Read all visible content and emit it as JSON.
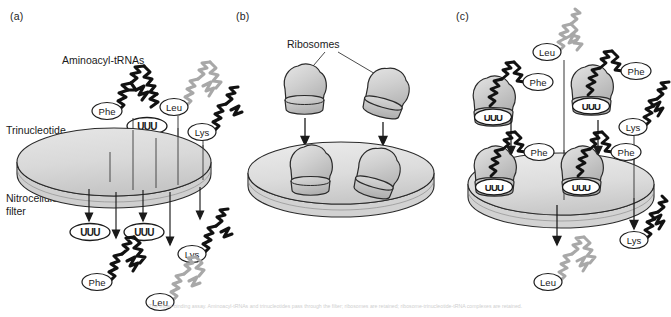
{
  "figure": {
    "width": 671,
    "height": 317,
    "caption": "The triplet-binding assay. Aminoacyl-tRNAs and trinucleotides pass through the filter; ribosomes are retained; ribosome-trinucleotide-tRNA complexes are retained."
  },
  "colors": {
    "ink": "#1a1a1a",
    "outline": "#2a2a2a",
    "disk_fill_top": "#d8d8d8",
    "disk_fill_edge": "#c4c4c4",
    "ribosome_fill": "#c9c9c9",
    "ribosome_fill_light": "#d9d9d9",
    "trna_dark": "#111111",
    "trna_light": "#a8a8a8",
    "label_fill": "#ffffff"
  },
  "panels": [
    {
      "id": "a",
      "label": "(a)",
      "annotations": [
        {
          "name": "aminoacyl-trnas",
          "text": "Aminoacyl-tRNAs"
        },
        {
          "name": "trinucleotide",
          "text": "Trinucleotide"
        },
        {
          "name": "nitrocellulose-filter",
          "text": "Nitrocellulose\nfilter"
        }
      ],
      "above_filter": {
        "trnas": [
          {
            "name": "phe-trna-above",
            "amino_acid": "Phe",
            "shade": "dark"
          },
          {
            "name": "leu-trna-above",
            "amino_acid": "Leu",
            "shade": "light"
          },
          {
            "name": "lys-trna-above",
            "amino_acid": "Lys",
            "shade": "dark"
          }
        ],
        "trinucleotides": [
          {
            "name": "trinucleotide-above-1",
            "codon": "UUU"
          },
          {
            "name": "trinucleotide-above-2",
            "codon": "UUU"
          }
        ]
      },
      "below_filter": {
        "trinucleotides": [
          {
            "name": "trinucleotide-below-1",
            "codon": "UUU"
          },
          {
            "name": "trinucleotide-below-2",
            "codon": "UUU"
          }
        ],
        "trnas": [
          {
            "name": "phe-trna-below",
            "amino_acid": "Phe",
            "shade": "dark"
          },
          {
            "name": "leu-trna-below",
            "amino_acid": "Leu",
            "shade": "light"
          },
          {
            "name": "lys-trna-below",
            "amino_acid": "Lys",
            "shade": "dark"
          }
        ]
      },
      "arrow_count": 5
    },
    {
      "id": "b",
      "label": "(b)",
      "annotations": [
        {
          "name": "ribosomes",
          "text": "Ribosomes"
        }
      ],
      "above_filter": {
        "ribosomes": [
          {
            "name": "ribosome-above-1"
          },
          {
            "name": "ribosome-above-2"
          }
        ]
      },
      "on_filter": {
        "ribosomes": [
          {
            "name": "ribosome-on-filter-1"
          },
          {
            "name": "ribosome-on-filter-2"
          }
        ]
      },
      "arrow_count": 2
    },
    {
      "id": "c",
      "label": "(c)",
      "above_filter": {
        "complexes": [
          {
            "name": "ribosome-complex-above-1",
            "codon": "UUU",
            "amino_acid": "Phe",
            "shade": "dark"
          },
          {
            "name": "ribosome-complex-above-2",
            "codon": "UUU",
            "amino_acid": "Phe",
            "shade": "dark"
          }
        ],
        "trnas": [
          {
            "name": "leu-trna-above",
            "amino_acid": "Leu",
            "shade": "light"
          },
          {
            "name": "lys-trna-above",
            "amino_acid": "Lys",
            "shade": "dark"
          }
        ]
      },
      "on_filter": {
        "complexes": [
          {
            "name": "ribosome-complex-on-filter-1",
            "codon": "UUU",
            "amino_acid": "Phe",
            "shade": "dark"
          },
          {
            "name": "ribosome-complex-on-filter-2",
            "codon": "UUU",
            "amino_acid": "Phe",
            "shade": "dark"
          }
        ]
      },
      "below_filter": {
        "trnas": [
          {
            "name": "leu-trna-below",
            "amino_acid": "Leu",
            "shade": "light"
          },
          {
            "name": "lys-trna-below",
            "amino_acid": "Lys",
            "shade": "dark"
          }
        ]
      },
      "arrow_count": 4
    }
  ]
}
